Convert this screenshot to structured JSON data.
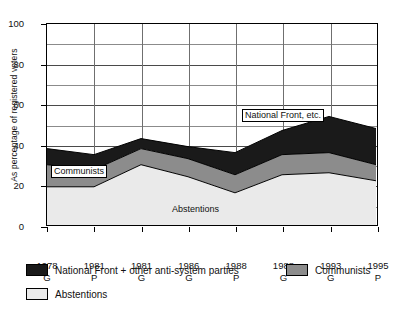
{
  "axes": {
    "ylabel": "As percentage of registered voters",
    "yticks": [
      0,
      20,
      40,
      60,
      80,
      100
    ],
    "ygrid_minor": [
      10,
      30,
      50,
      70,
      90
    ],
    "ylim": [
      0,
      100
    ]
  },
  "xlabels": [
    {
      "year": "1978",
      "type": "G"
    },
    {
      "year": "1981",
      "type": "P"
    },
    {
      "year": "1981",
      "type": "G"
    },
    {
      "year": "1986",
      "type": "G"
    },
    {
      "year": "1988",
      "type": "P"
    },
    {
      "year": "1988",
      "type": "G"
    },
    {
      "year": "1993",
      "type": "G"
    },
    {
      "year": "1995",
      "type": "P"
    }
  ],
  "callouts": {
    "communists": "Communists",
    "abstentions": "Abstentions",
    "national_front": "National Front, etc."
  },
  "legend": {
    "national_front": "National Front + other anti-system parties",
    "communists": "Communists",
    "abstentions": "Abstentions"
  },
  "colors": {
    "national_front": "#1a1a1a",
    "communists": "#8c8c8c",
    "abstentions": "#eaeaea",
    "grid": "#8b8b8b",
    "axis": "#000000"
  },
  "chart_data": {
    "type": "area",
    "stacked": true,
    "title": "",
    "xlabel": "",
    "ylabel": "As percentage of registered voters",
    "ylim": [
      0,
      100
    ],
    "grid": true,
    "legend_position": "bottom",
    "categories": [
      "1978 G",
      "1981 P",
      "1981 G",
      "1986 G",
      "1988 P",
      "1988 G",
      "1993 G",
      "1995 P"
    ],
    "series": [
      {
        "name": "Abstentions",
        "values": [
          19,
          19,
          30,
          24,
          16,
          25,
          26,
          22
        ]
      },
      {
        "name": "Communists",
        "values": [
          11,
          8.5,
          8,
          9,
          9,
          10,
          10,
          8
        ]
      },
      {
        "name": "National Front + other anti-system parties",
        "values": [
          8,
          7.5,
          5,
          6,
          11,
          12,
          18,
          18
        ]
      }
    ],
    "cumulative_tops": {
      "abstentions": [
        19,
        19,
        30,
        24,
        16,
        25,
        26,
        22
      ],
      "plus_communists": [
        30,
        27.5,
        38,
        33,
        25,
        35,
        36,
        30
      ],
      "plus_national_front": [
        38,
        35,
        43,
        39,
        36,
        47,
        54,
        48
      ]
    }
  }
}
